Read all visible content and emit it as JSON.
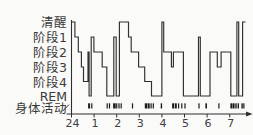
{
  "chart_data": {
    "type": "line",
    "subtype": "hypnogram-step",
    "title": "",
    "legend": null,
    "grid": false,
    "background_color": "#fafaf8",
    "line_color": "#2f2f2f",
    "text_color": "#3a3a3a",
    "mark_color": "#1c1c1c",
    "stage_axis_labels": [
      "清醒",
      "阶段1",
      "阶段2",
      "阶段3",
      "阶段4",
      "REM",
      "身体活动"
    ],
    "x_tick_labels": [
      "24",
      "1",
      "2",
      "3",
      "4",
      "5",
      "6",
      "7"
    ],
    "x_axis_range_hours": [
      0,
      7.7
    ],
    "x_axis_start_label_meaning": "24:00 (midnight)",
    "stage_levels_y": {
      "awake": 22,
      "s1": 37,
      "s2": 52,
      "s3": 67,
      "s4": 81.5,
      "rem": 96
    },
    "stage_label_y": [
      22,
      37,
      52,
      67,
      82,
      96,
      108
    ],
    "segments": [
      [
        0.0,
        0.15,
        "awake"
      ],
      [
        0.15,
        0.3,
        "s1"
      ],
      [
        0.3,
        0.44,
        "s2"
      ],
      [
        0.44,
        0.53,
        "s3"
      ],
      [
        0.53,
        0.73,
        "s4"
      ],
      [
        0.73,
        0.78,
        "s2"
      ],
      [
        0.78,
        0.87,
        "rem"
      ],
      [
        0.87,
        0.99,
        "s1"
      ],
      [
        0.99,
        1.36,
        "s2"
      ],
      [
        1.36,
        1.56,
        "s3"
      ],
      [
        1.56,
        1.87,
        "rem"
      ],
      [
        1.87,
        1.98,
        "s1"
      ],
      [
        1.98,
        2.12,
        "rem"
      ],
      [
        2.12,
        2.52,
        "awake"
      ],
      [
        2.52,
        2.64,
        "s1"
      ],
      [
        2.64,
        2.97,
        "s2"
      ],
      [
        2.97,
        3.24,
        "s3"
      ],
      [
        3.24,
        3.54,
        "s4"
      ],
      [
        3.54,
        4.0,
        "rem"
      ],
      [
        4.0,
        4.08,
        "awake"
      ],
      [
        4.08,
        4.42,
        "s2"
      ],
      [
        4.42,
        4.51,
        "s3"
      ],
      [
        4.51,
        4.95,
        "s2"
      ],
      [
        4.95,
        5.62,
        "rem"
      ],
      [
        5.62,
        5.7,
        "s1"
      ],
      [
        5.7,
        6.13,
        "rem"
      ],
      [
        6.13,
        6.45,
        "s2"
      ],
      [
        6.45,
        6.62,
        "s3"
      ],
      [
        6.62,
        7.05,
        "s2"
      ],
      [
        7.05,
        7.32,
        "rem"
      ],
      [
        7.32,
        7.4,
        "awake"
      ],
      [
        7.4,
        7.57,
        "rem"
      ],
      [
        7.57,
        7.7,
        "awake"
      ]
    ],
    "movement_marks": [
      [
        0.78,
        2.0
      ],
      [
        0.9,
        1.2
      ],
      [
        1.58,
        1.2
      ],
      [
        1.68,
        1.2
      ],
      [
        1.9,
        2.6
      ],
      [
        2.0,
        1.2
      ],
      [
        2.1,
        1.2
      ],
      [
        2.2,
        1.2
      ],
      [
        2.7,
        1.2
      ],
      [
        3.3,
        2.6
      ],
      [
        3.42,
        1.8
      ],
      [
        3.52,
        1.2
      ],
      [
        3.62,
        1.2
      ],
      [
        3.98,
        1.4
      ],
      [
        4.5,
        2.2
      ],
      [
        4.62,
        1.8
      ],
      [
        4.74,
        1.2
      ],
      [
        4.88,
        1.2
      ],
      [
        5.02,
        1.2
      ],
      [
        5.64,
        1.2
      ],
      [
        5.96,
        1.6
      ],
      [
        6.52,
        1.2
      ],
      [
        7.08,
        2.2
      ],
      [
        7.18,
        1.6
      ],
      [
        7.28,
        1.4
      ],
      [
        7.38,
        1.4
      ],
      [
        7.55,
        1.4
      ],
      [
        7.63,
        1.2
      ]
    ]
  }
}
